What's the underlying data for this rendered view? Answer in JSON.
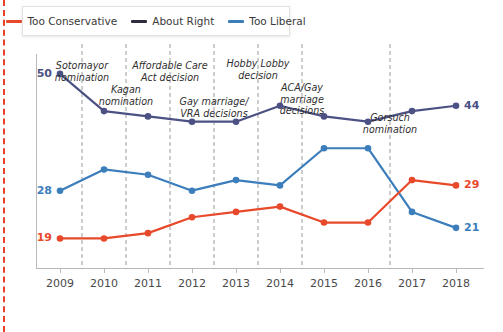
{
  "legend": {
    "items": [
      {
        "label": "Too Conservative",
        "color": "#e8492b",
        "icon": "line-swatch-icon"
      },
      {
        "label": "About Right",
        "color": "#4c5184",
        "icon": "line-swatch-icon"
      },
      {
        "label": "Too Liberal",
        "color": "#3b7ebb",
        "icon": "line-swatch-icon"
      }
    ]
  },
  "annotations": [
    {
      "text": "Sotomayor\nnomination",
      "x": 2009.5
    },
    {
      "text": "Kagan\nnomination",
      "x": 2010.5
    },
    {
      "text": "Affordable Care\nAct decision",
      "x": 2011.5
    },
    {
      "text": "Gay marriage/\nVRA decisions",
      "x": 2012.5
    },
    {
      "text": "Hobby Lobby\ndecision",
      "x": 2013.5
    },
    {
      "text": "ACA/Gay\nmarriage\ndecisions",
      "x": 2014.5
    },
    {
      "text": "Gorsuch\nnomination",
      "x": 2016.5
    }
  ],
  "end_labels": {
    "start": [
      {
        "value": "50",
        "color": "#4c5184"
      },
      {
        "value": "28",
        "color": "#3b7ebb"
      },
      {
        "value": "19",
        "color": "#e8492b"
      }
    ],
    "end": [
      {
        "value": "44",
        "color": "#4c5184"
      },
      {
        "value": "29",
        "color": "#e8492b"
      },
      {
        "value": "21",
        "color": "#3b7ebb"
      }
    ]
  },
  "chart_data": {
    "type": "line",
    "title": "",
    "subtitle": "",
    "xlabel": "",
    "ylabel": "",
    "xlim": [
      2009,
      2018
    ],
    "ylim": [
      14,
      53
    ],
    "grid": false,
    "legend_position": "top-left",
    "categories": [
      2009,
      2010,
      2011,
      2012,
      2013,
      2014,
      2015,
      2016,
      2017,
      2018
    ],
    "tick_labels": [
      "2009",
      "2010",
      "2011",
      "2012",
      "2013",
      "2014",
      "2015",
      "2016",
      "2017",
      "2018"
    ],
    "series": [
      {
        "name": "About Right",
        "color": "#4c5184",
        "values": [
          50,
          43,
          42,
          41,
          41,
          44,
          42,
          41,
          43,
          44
        ]
      },
      {
        "name": "Too Liberal",
        "color": "#3b7ebb",
        "values": [
          28,
          32,
          31,
          28,
          30,
          29,
          36,
          36,
          24,
          21
        ]
      },
      {
        "name": "Too Conservative",
        "color": "#e8492b",
        "values": [
          19,
          19,
          20,
          23,
          24,
          25,
          22,
          22,
          30,
          29
        ]
      }
    ],
    "vertical_markers": [
      2009.5,
      2010.5,
      2011.5,
      2012.5,
      2013.5,
      2014.5,
      2016.5
    ]
  }
}
